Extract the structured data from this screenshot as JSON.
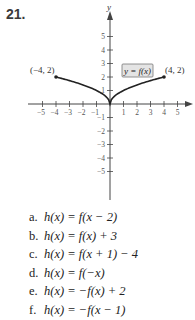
{
  "problem": {
    "number": "21.",
    "items": [
      {
        "label": "a.",
        "text": "h(x) = f(x − 2)"
      },
      {
        "label": "b.",
        "text": "h(x) = f(x) + 3"
      },
      {
        "label": "c.",
        "text": "h(x) = f(x + 1) − 4"
      },
      {
        "label": "d.",
        "text": "h(x) = f(−x)"
      },
      {
        "label": "e.",
        "text": "h(x) = −f(x) + 2"
      },
      {
        "label": "f.",
        "text": "h(x) = −f(x − 1)"
      }
    ]
  },
  "chart_data": {
    "type": "line",
    "title": "",
    "xlabel": "",
    "ylabel": "y",
    "xlim": [
      -5,
      5
    ],
    "ylim": [
      -5,
      5
    ],
    "x_ticks": [
      -5,
      -4,
      -3,
      -2,
      -1,
      1,
      2,
      3,
      4,
      5
    ],
    "y_ticks": [
      -5,
      -4,
      -3,
      -2,
      -1,
      1,
      2,
      3,
      4,
      5
    ],
    "grid": false,
    "series": [
      {
        "name": "y = f(x)",
        "x": [
          -4,
          -2,
          0,
          2,
          4
        ],
        "y": [
          2,
          1.41,
          0,
          1.41,
          2
        ],
        "shape": "concave curves meeting at origin (sqrt of |x| shape)"
      }
    ],
    "annotations": [
      {
        "text": "(−4, 2)",
        "x": -4,
        "y": 2
      },
      {
        "text": "(4, 2)",
        "x": 4,
        "y": 2
      },
      {
        "text": "y = f(x)",
        "boxed": true
      }
    ]
  }
}
